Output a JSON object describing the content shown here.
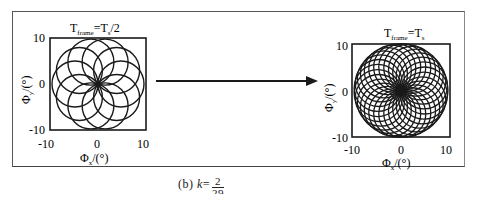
{
  "figure": {
    "left_panel": {
      "title_main": "T",
      "title_sub": "frame",
      "title_rest": "=T",
      "title_sub2": "s",
      "title_tail": "/2",
      "xlabel_main": "Φ",
      "xlabel_sub": "x",
      "xlabel_unit": "/(°)",
      "ylabel_main": "Φ",
      "ylabel_sub": "y",
      "ylabel_unit": "/(°)",
      "xticks": [
        "-10",
        "0",
        "10"
      ],
      "yticks": [
        "10",
        "0",
        "-10"
      ],
      "pattern": {
        "type": "rose",
        "petals": 10,
        "circles": 10
      }
    },
    "right_panel": {
      "title_main": "T",
      "title_sub": "frame",
      "title_rest": "=T",
      "title_sub2": "s",
      "title_tail": "",
      "xlabel_main": "Φ",
      "xlabel_sub": "x",
      "xlabel_unit": "/(°)",
      "ylabel_main": "Φ",
      "ylabel_sub": "y",
      "ylabel_unit": "/(°)",
      "xticks": [
        "-10",
        "0",
        "10"
      ],
      "yticks": [
        "10",
        "0",
        "-10"
      ],
      "pattern": {
        "type": "rose",
        "circles": 29
      }
    },
    "arrow": "right-arrow",
    "caption": {
      "label": "(b)",
      "var": "k",
      "eq": "=",
      "num": "2",
      "den": "29"
    }
  }
}
